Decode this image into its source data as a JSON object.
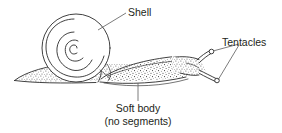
{
  "figure": {
    "style": "black-and-white line art with stippled body texture",
    "background_color": "#ffffff",
    "ink_color": "#2b2b2b",
    "leader_color": "#5a5a5a",
    "text_color": "#231f20"
  },
  "labels": {
    "shell": "Shell",
    "tentacles": "Tentacles",
    "soft_body_line1": "Soft body",
    "soft_body_line2": "(no segments)"
  },
  "parts": [
    {
      "name": "shell",
      "label": "Shell",
      "description": "planispiral coiled shell"
    },
    {
      "name": "tentacles",
      "label": "Tentacles",
      "description": "two knob-tipped head tentacles"
    },
    {
      "name": "soft-body",
      "label": "Soft body (no segments)",
      "description": "stippled muscular foot and body"
    }
  ]
}
